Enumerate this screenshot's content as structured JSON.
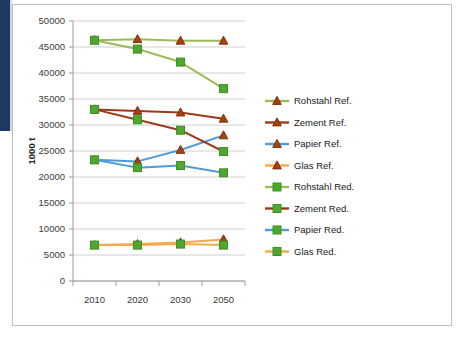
{
  "chart_data": {
    "type": "line",
    "title": "",
    "xlabel": "",
    "ylabel": "1000 t",
    "categories": [
      "2010",
      "2020",
      "2030",
      "2050"
    ],
    "x": [
      2010,
      2020,
      2030,
      2050
    ],
    "ylim": [
      0,
      50000
    ],
    "ytick_step": 5000,
    "yticks": [
      "0",
      "5000",
      "10000",
      "15000",
      "20000",
      "25000",
      "30000",
      "35000",
      "40000",
      "45000",
      "50000"
    ],
    "ytick_values": [
      0,
      5000,
      10000,
      15000,
      20000,
      25000,
      30000,
      35000,
      40000,
      45000,
      50000
    ],
    "grid": "horizontal",
    "legend_position": "right",
    "series": [
      {
        "name": "Rohstahl Ref.",
        "values": [
          46300,
          46500,
          46200,
          46200
        ],
        "line_color": "#9BBB59",
        "marker": "triangle",
        "marker_color": "#A8410E"
      },
      {
        "name": "Zement Ref.",
        "values": [
          33000,
          32700,
          32400,
          31200
        ],
        "line_color": "#9E3A1B",
        "marker": "triangle",
        "marker_color": "#A8410E"
      },
      {
        "name": "Papier Ref.",
        "values": [
          23300,
          23000,
          25200,
          28000
        ],
        "line_color": "#4F9BD9",
        "marker": "triangle",
        "marker_color": "#A8410E"
      },
      {
        "name": "Glas Ref.",
        "values": [
          6900,
          7100,
          7400,
          8000
        ],
        "line_color": "#F5A94E",
        "marker": "triangle",
        "marker_color": "#A8410E"
      },
      {
        "name": "Rohstahl Red.",
        "values": [
          46300,
          44600,
          42100,
          37000
        ],
        "line_color": "#9BBB59",
        "marker": "square",
        "marker_color": "#4EA72E"
      },
      {
        "name": "Zement Red.",
        "values": [
          33000,
          31000,
          29000,
          24900
        ],
        "line_color": "#9E3A1B",
        "marker": "square",
        "marker_color": "#4EA72E"
      },
      {
        "name": "Papier Red.",
        "values": [
          23300,
          21800,
          22200,
          20800
        ],
        "line_color": "#4F9BD9",
        "marker": "square",
        "marker_color": "#4EA72E"
      },
      {
        "name": "Glas Red.",
        "values": [
          6900,
          6900,
          7100,
          6900
        ],
        "line_color": "#F5A94E",
        "marker": "square",
        "marker_color": "#4EA72E"
      }
    ]
  },
  "colors": {
    "accent_navy": "#1F3864",
    "frame_border": "#bfbfbf",
    "gridline": "#d0d0d0",
    "axis": "#9a9a9a"
  }
}
